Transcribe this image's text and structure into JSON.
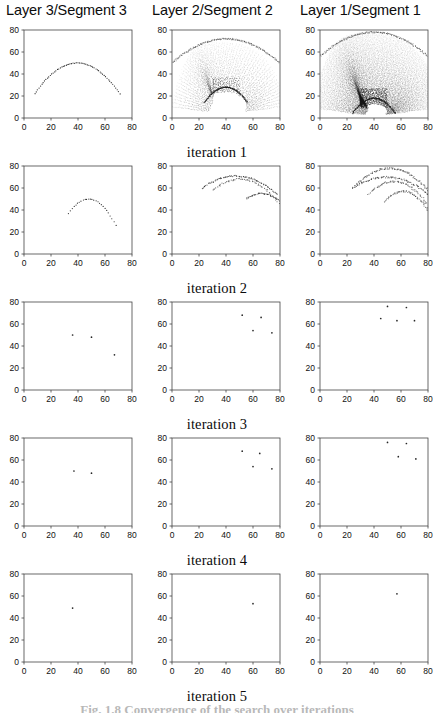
{
  "figure": {
    "column_titles": [
      "Layer 3/Segment 3",
      "Layer 2/Segment 2",
      "Layer 1/Segment 1"
    ],
    "row_labels": [
      "iteration 1",
      "iteration 2",
      "iteration 3",
      "iteration 4",
      "iteration 5"
    ],
    "caption": "Fig. 1.8  Convergence of the search over iterations"
  },
  "chart_data": {
    "type": "scatter",
    "title": "",
    "xlabel": "",
    "ylabel": "",
    "xlim": [
      0,
      80
    ],
    "ylim": [
      0,
      80
    ],
    "xticks": [
      0,
      20,
      40,
      60,
      80
    ],
    "yticks": [
      0,
      20,
      40,
      60,
      80
    ],
    "grid": false,
    "legend": "none",
    "marker_color": "#1a1a1a",
    "frame_color": "#444444",
    "n_rows": 5,
    "n_cols": 3,
    "row_names": [
      "iteration 1",
      "iteration 2",
      "iteration 3",
      "iteration 4",
      "iteration 5"
    ],
    "col_names": [
      "Layer 3/Segment 3",
      "Layer 2/Segment 2",
      "Layer 1/Segment 1"
    ],
    "panels": [
      {
        "row": 1,
        "col": 1,
        "label": "iteration 1 / Layer 3/Segment 3",
        "pattern": "single-arc",
        "description": "sparse dotted arc peaking near (40,50)",
        "n_points": 60,
        "arcs": [
          {
            "x0": 8,
            "x1": 71,
            "ytop": 50,
            "yedge": 22,
            "density": 60,
            "opacity": 0.95,
            "jitter": 0.5
          }
        ]
      },
      {
        "row": 1,
        "col": 2,
        "label": "iteration 1 / Layer 2/Segment 2",
        "pattern": "caustic-fan",
        "description": "dense radiating dot fan, outer dome y=72, inner cusp arc peaking at (40,28)",
        "n_points": 4200,
        "fan": {
          "cx": 40,
          "cy": 4,
          "r_inner": 24,
          "r_outer": 70,
          "n_rays": 64,
          "n_steps": 46,
          "cusp_top": 28,
          "dome_top": 72
        }
      },
      {
        "row": 1,
        "col": 3,
        "label": "iteration 1 / Layer 1/Segment 1",
        "pattern": "caustic-cloud",
        "description": "very dense grey cloud filling frame with darker caustic arcs and dark cusp near (40,18)",
        "n_points": 9000,
        "fan": {
          "cx": 40,
          "cy": 2,
          "r_inner": 14,
          "r_outer": 80,
          "n_rays": 150,
          "n_steps": 70,
          "cusp_top": 18,
          "dome_top": 78
        }
      },
      {
        "row": 2,
        "col": 1,
        "label": "iteration 2 / Layer 3/Segment 3",
        "pattern": "short-arc",
        "description": "short dotted arc from (33,49) to (68,32)",
        "n_points": 26,
        "arcs": [
          {
            "x0": 33,
            "x1": 68,
            "ytop": 50,
            "yedge": 32,
            "density": 26,
            "opacity": 0.9,
            "jitter": 0.6,
            "skew": 0.85
          }
        ]
      },
      {
        "row": 2,
        "col": 2,
        "label": "iteration 2 / Layer 2/Segment 2",
        "pattern": "sparse-arcs",
        "description": "two or three broken arcs spanning x 20-80 at y 50-72",
        "n_points": 180,
        "arcs": [
          {
            "x0": 22,
            "x1": 78,
            "ytop": 71,
            "yedge": 57,
            "density": 70,
            "opacity": 0.75,
            "jitter": 1.2,
            "skew": 0.9
          },
          {
            "x0": 30,
            "x1": 80,
            "ytop": 68,
            "yedge": 52,
            "density": 55,
            "opacity": 0.6,
            "jitter": 1.4,
            "skew": 0.8
          },
          {
            "x0": 55,
            "x1": 80,
            "ytop": 55,
            "yedge": 49,
            "density": 40,
            "opacity": 0.7,
            "jitter": 1.0,
            "skew": 0.9
          }
        ]
      },
      {
        "row": 2,
        "col": 3,
        "label": "iteration 2 / Layer 1/Segment 1",
        "pattern": "sparse-arcs",
        "description": "several overlapping broken arcs, x 25-80, y 43-78",
        "n_points": 320,
        "arcs": [
          {
            "x0": 26,
            "x1": 80,
            "ytop": 78,
            "yedge": 60,
            "density": 90,
            "opacity": 0.6,
            "jitter": 1.6,
            "skew": 0.95
          },
          {
            "x0": 24,
            "x1": 80,
            "ytop": 70,
            "yedge": 57,
            "density": 80,
            "opacity": 0.65,
            "jitter": 1.5,
            "skew": 0.9
          },
          {
            "x0": 36,
            "x1": 80,
            "ytop": 66,
            "yedge": 50,
            "density": 70,
            "opacity": 0.55,
            "jitter": 1.6,
            "skew": 0.85
          },
          {
            "x0": 48,
            "x1": 80,
            "ytop": 57,
            "yedge": 44,
            "density": 55,
            "opacity": 0.6,
            "jitter": 1.3,
            "skew": 0.85
          }
        ]
      },
      {
        "row": 3,
        "col": 1,
        "label": "iteration 3 / Layer 3/Segment 3",
        "pattern": "points",
        "n_points": 3,
        "points": [
          [
            36,
            50
          ],
          [
            50,
            48
          ],
          [
            67,
            32
          ]
        ]
      },
      {
        "row": 3,
        "col": 2,
        "label": "iteration 3 / Layer 2/Segment 2",
        "pattern": "points",
        "n_points": 4,
        "points": [
          [
            52,
            68
          ],
          [
            66,
            66
          ],
          [
            60,
            54
          ],
          [
            74,
            52
          ]
        ]
      },
      {
        "row": 3,
        "col": 3,
        "label": "iteration 3 / Layer 1/Segment 1",
        "pattern": "points",
        "n_points": 5,
        "points": [
          [
            50,
            76
          ],
          [
            64,
            75
          ],
          [
            45,
            65
          ],
          [
            57,
            63
          ],
          [
            70,
            63
          ]
        ]
      },
      {
        "row": 4,
        "col": 1,
        "label": "iteration 4 / Layer 3/Segment 3",
        "pattern": "points",
        "n_points": 2,
        "points": [
          [
            37,
            50
          ],
          [
            50,
            48
          ]
        ]
      },
      {
        "row": 4,
        "col": 2,
        "label": "iteration 4 / Layer 2/Segment 2",
        "pattern": "points",
        "n_points": 4,
        "points": [
          [
            52,
            68
          ],
          [
            65,
            66
          ],
          [
            60,
            54
          ],
          [
            74,
            52
          ]
        ]
      },
      {
        "row": 4,
        "col": 3,
        "label": "iteration 4 / Layer 1/Segment 1",
        "pattern": "points",
        "n_points": 4,
        "points": [
          [
            50,
            76
          ],
          [
            64,
            75
          ],
          [
            58,
            63
          ],
          [
            71,
            61
          ]
        ]
      },
      {
        "row": 5,
        "col": 1,
        "label": "iteration 5 / Layer 3/Segment 3",
        "pattern": "points",
        "n_points": 1,
        "points": [
          [
            36,
            49
          ]
        ]
      },
      {
        "row": 5,
        "col": 2,
        "label": "iteration 5 / Layer 2/Segment 2",
        "pattern": "points",
        "n_points": 1,
        "points": [
          [
            60,
            53
          ]
        ]
      },
      {
        "row": 5,
        "col": 3,
        "label": "iteration 5 / Layer 1/Segment 1",
        "pattern": "points",
        "n_points": 1,
        "points": [
          [
            57,
            62
          ]
        ]
      }
    ]
  }
}
